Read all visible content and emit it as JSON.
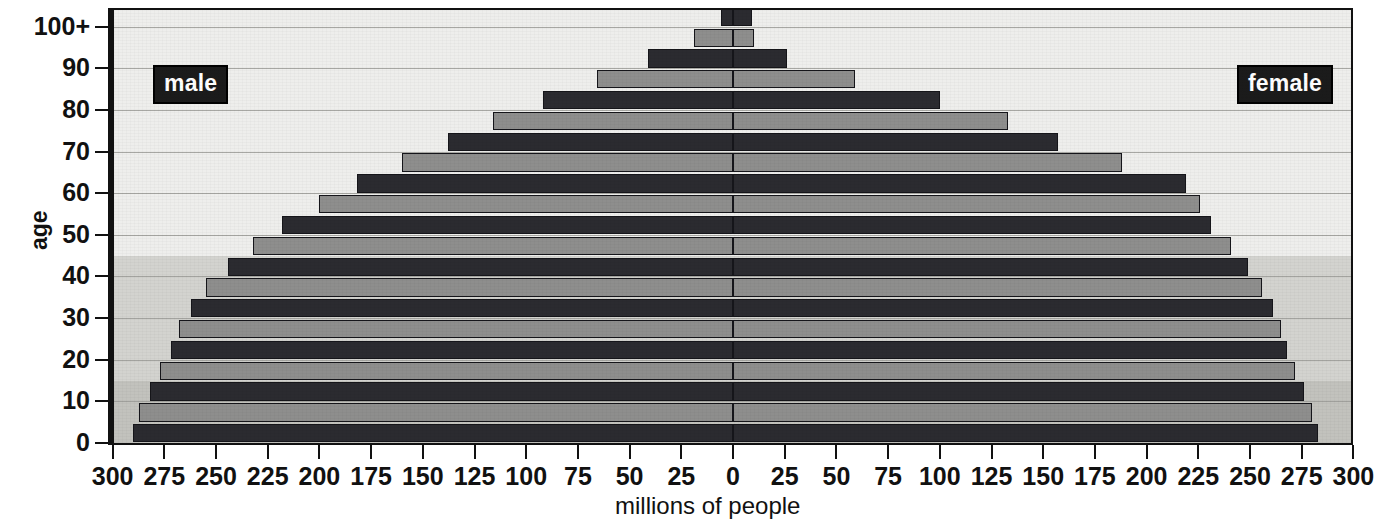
{
  "chart_data": {
    "type": "bar",
    "title": "",
    "subtitle": "",
    "orientation": "horizontal-diverging",
    "xlabel": "millions of people",
    "ylabel": "age",
    "units": "millions of people",
    "xlim": [
      -300,
      300
    ],
    "xtick_labels": [
      "300",
      "275",
      "250",
      "225",
      "200",
      "175",
      "150",
      "125",
      "100",
      "75",
      "50",
      "25",
      "0",
      "25",
      "50",
      "75",
      "100",
      "125",
      "150",
      "175",
      "200",
      "225",
      "250",
      "275",
      "300"
    ],
    "xtick_values": [
      -300,
      -275,
      -250,
      -225,
      -200,
      -175,
      -150,
      -125,
      -100,
      -75,
      -50,
      -25,
      0,
      25,
      50,
      75,
      100,
      125,
      150,
      175,
      200,
      225,
      250,
      275,
      300
    ],
    "ytick_labels": [
      "0",
      "10",
      "20",
      "30",
      "40",
      "50",
      "60",
      "70",
      "80",
      "90",
      "100+"
    ],
    "ytick_values": [
      0,
      10,
      20,
      30,
      40,
      50,
      60,
      70,
      80,
      90,
      100
    ],
    "ylim": [
      0,
      104
    ],
    "grid": true,
    "legend": [
      "male",
      "female"
    ],
    "legend_position": "inside-top-left and inside-top-right",
    "age_group_width": 4,
    "categories": [
      "0-4",
      "5-9",
      "10-14",
      "15-19",
      "20-24",
      "25-29",
      "30-34",
      "35-39",
      "40-44",
      "45-49",
      "50-54",
      "55-59",
      "60-64",
      "65-69",
      "70-74",
      "75-79",
      "80-84",
      "85-89",
      "90-94",
      "95-99",
      "100+"
    ],
    "series": [
      {
        "name": "male",
        "side": "left",
        "values": [
          290,
          287,
          282,
          277,
          272,
          268,
          262,
          255,
          244,
          232,
          218,
          200,
          182,
          160,
          138,
          116,
          92,
          66,
          41,
          19,
          6
        ]
      },
      {
        "name": "female",
        "side": "right",
        "values": [
          283,
          280,
          276,
          272,
          268,
          265,
          261,
          256,
          249,
          241,
          231,
          226,
          219,
          188,
          157,
          133,
          100,
          59,
          26,
          10,
          9
        ]
      }
    ]
  },
  "axes": {
    "x_title": "millions of people",
    "y_title": "age"
  },
  "legend": {
    "male_label": "male",
    "female_label": "female"
  },
  "colors": {
    "plot_background": "#eeeeec",
    "band_light": "#eeeeec",
    "band_mid": "#d3d3cf",
    "band_dark": "#c2c2bd",
    "bar_dark": "#2b2b30",
    "bar_light": "#8e8e8d",
    "axis": "#111111",
    "grid": "#9a9a97",
    "legend_chip_bg": "#1b1b1b",
    "legend_chip_text": "#ffffff"
  }
}
